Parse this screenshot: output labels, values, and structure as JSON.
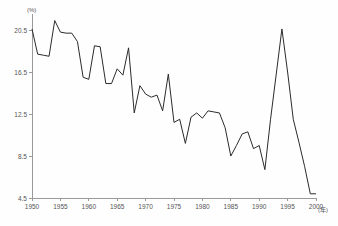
{
  "chart_data": {
    "type": "line",
    "title": "",
    "subtitle": "",
    "xlabel": "(年)",
    "ylabel": "(%)",
    "y_unit_label": "(%)",
    "x_unit_label": "(年)",
    "xlim": [
      1950,
      2000
    ],
    "ylim": [
      4.5,
      22.0
    ],
    "yticks": [
      4.5,
      8.5,
      12.5,
      16.5,
      20.5
    ],
    "ytick_labels": [
      "4.5",
      "8.5",
      "12.5",
      "16.5",
      "20.5"
    ],
    "xticks": [
      1950,
      1955,
      1960,
      1965,
      1970,
      1975,
      1980,
      1985,
      1990,
      1995,
      2000
    ],
    "xtick_labels": [
      "1950",
      "1955",
      "1960",
      "1965",
      "1970",
      "1975",
      "1980",
      "1985",
      "1990",
      "1995",
      "2000"
    ],
    "grid": false,
    "legend": null,
    "line_color": "#2b2b2b",
    "axis_color": "#9a9a9a",
    "background_color": "#fefefe",
    "x": [
      1950,
      1951,
      1952,
      1953,
      1954,
      1955,
      1956,
      1957,
      1958,
      1959,
      1960,
      1961,
      1962,
      1963,
      1964,
      1965,
      1966,
      1967,
      1968,
      1969,
      1970,
      1971,
      1972,
      1973,
      1974,
      1975,
      1976,
      1977,
      1978,
      1979,
      1980,
      1981,
      1982,
      1983,
      1984,
      1985,
      1986,
      1987,
      1988,
      1989,
      1990,
      1991,
      1992,
      1993,
      1994,
      1995,
      1996,
      1997,
      1998,
      1999,
      2000
    ],
    "values": [
      20.6,
      18.2,
      18.1,
      18.0,
      21.4,
      20.3,
      20.2,
      20.2,
      19.4,
      16.0,
      15.8,
      19.0,
      18.9,
      15.4,
      15.4,
      16.8,
      16.2,
      18.8,
      12.6,
      15.2,
      14.4,
      14.1,
      14.3,
      12.8,
      16.3,
      11.7,
      12.0,
      9.7,
      12.2,
      12.6,
      12.1,
      12.8,
      12.7,
      12.6,
      11.2,
      8.5,
      9.5,
      10.6,
      10.8,
      9.2,
      9.5,
      7.2,
      12.0,
      16.3,
      20.6,
      16.5,
      12.0,
      9.8,
      7.5,
      4.9,
      4.9
    ],
    "series": [
      {
        "name": "",
        "values": [
          20.6,
          18.2,
          18.1,
          18.0,
          21.4,
          20.3,
          20.2,
          20.2,
          19.4,
          16.0,
          15.8,
          19.0,
          18.9,
          15.4,
          15.4,
          16.8,
          16.2,
          18.8,
          12.6,
          15.2,
          14.4,
          14.1,
          14.3,
          12.8,
          16.3,
          11.7,
          12.0,
          9.7,
          12.2,
          12.6,
          12.1,
          12.8,
          12.7,
          12.6,
          11.2,
          8.5,
          9.5,
          10.6,
          10.8,
          9.2,
          9.5,
          7.2,
          12.0,
          16.3,
          20.6,
          16.5,
          12.0,
          9.8,
          7.5,
          4.9,
          4.9
        ]
      }
    ],
    "annotations": []
  }
}
